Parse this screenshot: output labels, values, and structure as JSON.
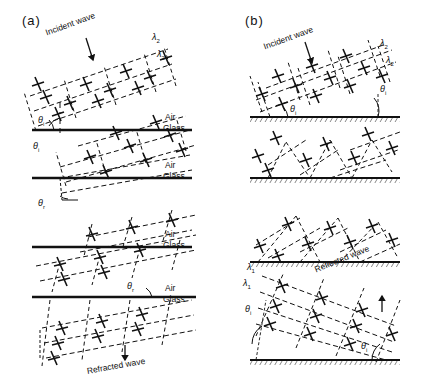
{
  "figure": {
    "type": "physics-wave-diagram",
    "panels": [
      {
        "id": "a",
        "label": "(a)",
        "phenomenon": "refraction",
        "interface": {
          "upper_medium": "Air",
          "lower_medium": "Glass"
        },
        "annotations": {
          "incident_wave": "Incident wave",
          "refracted_wave": "Refracted wave",
          "wavelength_1": "λ",
          "wavelength_1_sub": "2",
          "wavelength_2": "λ",
          "wavelength_2_sub": "2",
          "angle_incidence": "θ",
          "angle_incidence_sub": "i",
          "angle_refraction": "θ",
          "angle_refraction_sub": "r"
        },
        "stages": 4
      },
      {
        "id": "b",
        "label": "(b)",
        "phenomenon": "reflection",
        "interface": {
          "boundary": "hatched-rigid-surface"
        },
        "annotations": {
          "incident_wave": "Incident wave",
          "reflected_wave": "Reflected wave",
          "wavelength_top_1": "λ",
          "wavelength_top_1_sub": "2",
          "wavelength_top_2": "λ",
          "wavelength_top_2_sub": "2",
          "wavelength_bot_1": "λ",
          "wavelength_bot_1_sub": "1",
          "wavelength_bot_2": "λ",
          "wavelength_bot_2_sub": "1",
          "angle_incidence": "θ",
          "angle_incidence_sub": "i",
          "angle_incidence_2": "θ",
          "angle_incidence_2_sub": "i",
          "angle_incidence_3": "θ",
          "angle_incidence_3_sub": "i",
          "angle_incidence_4": "θ",
          "angle_incidence_4_sub": "i"
        },
        "stages": 4
      }
    ],
    "colors": {
      "ink": "#111111",
      "background": "#ffffff"
    }
  }
}
